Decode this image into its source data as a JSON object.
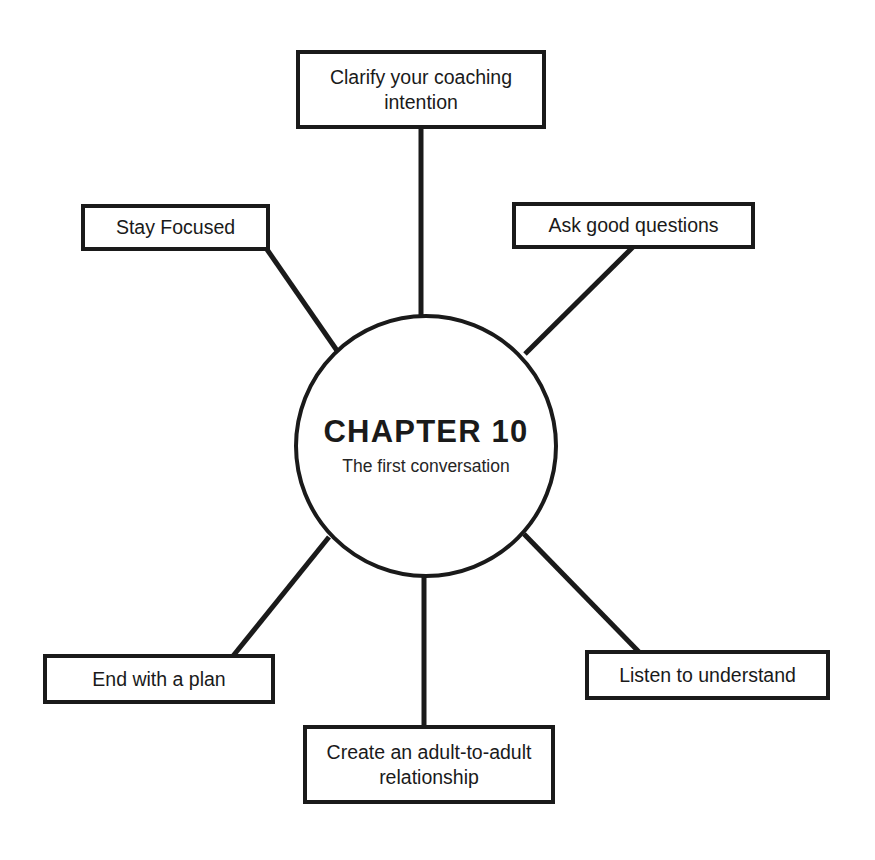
{
  "diagram": {
    "type": "hub-and-spoke mind map",
    "hub": {
      "title": "CHAPTER 10",
      "subtitle": "The first conversation"
    },
    "nodes": [
      {
        "id": "clarify",
        "label": "Clarify your coaching\nintention",
        "position": "top"
      },
      {
        "id": "stay-focused",
        "label": "Stay Focused",
        "position": "upper-left"
      },
      {
        "id": "ask-good",
        "label": "Ask good questions",
        "position": "upper-right"
      },
      {
        "id": "end-plan",
        "label": "End with a plan",
        "position": "lower-left"
      },
      {
        "id": "create-adult",
        "label": "Create an adult-to-adult\nrelationship",
        "position": "bottom"
      },
      {
        "id": "listen",
        "label": "Listen to understand",
        "position": "lower-right"
      }
    ],
    "colors": {
      "stroke": "#1a1a1a",
      "fill": "#ffffff",
      "text": "#1a1a1a"
    }
  }
}
